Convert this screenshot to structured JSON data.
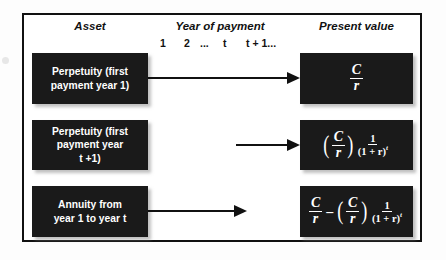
{
  "figure": {
    "headers": {
      "asset": "Asset",
      "year_of_payment": "Year of payment",
      "present_value": "Present value"
    },
    "year_ticks": [
      "1",
      "2",
      "...",
      "t",
      "t + 1..."
    ],
    "rows": [
      {
        "asset_lines": [
          "Perpetuity (first",
          "payment year 1)"
        ],
        "arrow": "long-arrow-right",
        "present_value_formula": "C / r"
      },
      {
        "asset_lines": [
          "Perpetuity (first",
          "payment year",
          "t +1)"
        ],
        "arrow": "short-arrow-right",
        "present_value_formula": "(C / r) × 1 / (1 + r)^t"
      },
      {
        "asset_lines": [
          "Annuity from",
          "year 1 to year t"
        ],
        "arrow": "medium-arrow-right",
        "present_value_formula": "C / r − (C / r) × 1 / (1 + r)^t"
      }
    ],
    "math_symbols": {
      "C": "C",
      "r": "r",
      "one": "1",
      "one_plus_r": "(1 + r)",
      "exponent_t": "t",
      "minus": "–"
    },
    "colors": {
      "box_fill": "#1a1a1a",
      "box_text": "#ffffff",
      "frame_border": "#111111",
      "page_background": "#ffffff"
    }
  }
}
